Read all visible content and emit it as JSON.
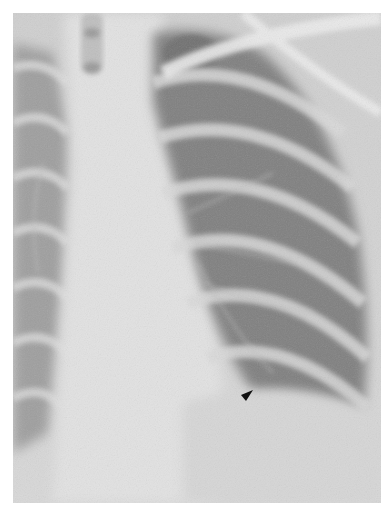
{
  "image": {
    "description": "Frontal chest radiograph, left hemithorax, arrowhead marker indicating finding near left lower zone",
    "annotation": {
      "marker": "arrowhead-icon",
      "marker_color": "#111111"
    },
    "colors": {
      "background": "#ffffff",
      "soft_tissue": "#d4d4d4",
      "lung_field": "#8e8e8e",
      "bone": "#e6e6e6"
    }
  }
}
